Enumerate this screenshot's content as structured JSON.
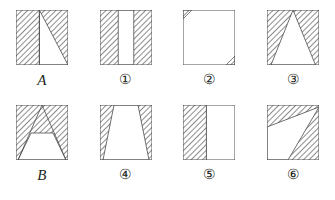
{
  "figure": {
    "stroke_color": "#4d4d4d",
    "hatch_color": "#555555",
    "fill_white": "#ffffff",
    "label_color": "#231f20",
    "hatch_direction": "backslash",
    "rows": [
      {
        "row_name": "row-1",
        "cells": [
          {
            "label": "A",
            "label_kind": "letter",
            "shape_name": "square-left-band-and-right-triangle",
            "description": "Square: left 45% fully hatched, vertical divider, right part hatched triangle with white triangle whose apex is at top of divider and base at bottom-right corner",
            "white_polygon": "23.4,0 52,55 23.4,55",
            "divider_x": 23.4
          },
          {
            "label": "①",
            "label_kind": "circled-number",
            "shape_name": "square-two-hatched-vertical-bands",
            "description": "Square: hatched vertical band on left and on right, white vertical band in centre",
            "white_rect": "18.2,0 15.6,55"
          },
          {
            "label": "②",
            "label_kind": "circled-number",
            "shape_name": "square-two-corner-triangles",
            "description": "Square: mostly white, small hatched right triangles at top-left and bottom-right corners",
            "hatch_polygons": [
              "0,0 9,0 0,9",
              "52,55 43,55 52,46"
            ]
          },
          {
            "label": "③",
            "label_kind": "circled-number",
            "shape_name": "square-white-triangle-apex-top",
            "description": "Square: hatched background with white triangle, apex at top centre, base along the bottom edge",
            "white_polygon": "26,0 48.5,55 4,55"
          }
        ]
      },
      {
        "row_name": "row-2",
        "cells": [
          {
            "label": "B",
            "label_kind": "letter",
            "shape_name": "square-white-trapezoid-with-peak-lines",
            "description": "Square: white trapezoid at bottom (narrow top, wide bottom) with horizontal top edge at mid height; two hatched lines form a peak from top centre to bottom corners",
            "white_polygon": "15,28 37,28 50,55 2,55",
            "peak_lines": [
              "26,0 2,55",
              "26,0 50,55"
            ]
          },
          {
            "label": "④",
            "label_kind": "circled-number",
            "shape_name": "square-white-trapezoid",
            "description": "Square: white trapezoid narrow at top, wide at bottom; hatched triangles at left and right",
            "white_polygon": "14,0 38,0 49,55 3,55"
          },
          {
            "label": "⑤",
            "label_kind": "circled-number",
            "shape_name": "square-left-hatched-band",
            "description": "Square: left 45% hatched, right 55% white, vertical dividing line",
            "divider_x": 23.4
          },
          {
            "label": "⑥",
            "label_kind": "circled-number",
            "shape_name": "square-white-quadrilateral-lower-left",
            "description": "Square: hatched top band and right side; white quadrilateral at lower left with a vertex reaching the top-right corner",
            "white_polygon": "52,2 0,22 0,55 21,55"
          }
        ]
      }
    ]
  }
}
